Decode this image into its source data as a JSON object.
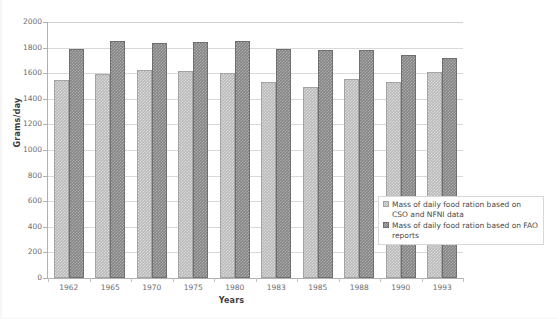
{
  "chart_data": {
    "type": "bar",
    "title": "",
    "xlabel": "Years",
    "ylabel": "Grams/day",
    "categories": [
      "1962",
      "1965",
      "1970",
      "1975",
      "1980",
      "1983",
      "1985",
      "1988",
      "1990",
      "1993"
    ],
    "ylim": [
      0,
      2000
    ],
    "yticks": [
      0,
      200,
      400,
      600,
      800,
      1000,
      1200,
      1400,
      1600,
      1800,
      2000
    ],
    "grid": true,
    "legend_position": "inside-right",
    "series": [
      {
        "name": "Mass of daily food ration based on CSO and NFNI data",
        "color": "#b9b9b9",
        "values": [
          1550,
          1595,
          1625,
          1620,
          1605,
          1535,
          1490,
          1555,
          1530,
          1610
        ]
      },
      {
        "name": "Mass of daily food ration based on FAO reports",
        "color": "#848484",
        "values": [
          1790,
          1855,
          1835,
          1840,
          1850,
          1790,
          1780,
          1780,
          1740,
          1715
        ]
      }
    ]
  },
  "legend": {
    "items": [
      {
        "label": "Mass of daily food ration based on CSO and NFNI data",
        "swatch": "series-0-swatch"
      },
      {
        "label": "Mass of daily food ration based on FAO reports",
        "swatch": "series-1-swatch"
      }
    ]
  },
  "axes": {
    "y_title": "Grams/day",
    "x_title": "Years",
    "y_tick_labels": [
      "2000",
      "1800",
      "1600",
      "1400",
      "1200",
      "1000",
      "800",
      "600",
      "400",
      "200",
      "0"
    ],
    "x_tick_labels": [
      "1962",
      "1965",
      "1970",
      "1975",
      "1980",
      "1983",
      "1985",
      "1988",
      "1990",
      "1993"
    ]
  }
}
